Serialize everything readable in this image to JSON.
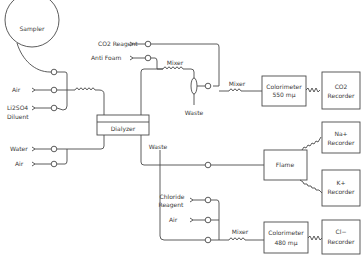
{
  "diagram": {
    "type": "flow-schematic",
    "nodes": {
      "sampler": {
        "label": "Sampler"
      },
      "air_1": {
        "label": "Air"
      },
      "diluent": {
        "label_line1": "Li2SO4",
        "label_line2": "Diluent"
      },
      "co2_reagent": {
        "label": "CO2 Reagent"
      },
      "anti_foam": {
        "label": "Anti Foam"
      },
      "mixer_top": {
        "label": "Mixer"
      },
      "waste_top": {
        "label": "Waste"
      },
      "mixer_co2": {
        "label": "Mixer"
      },
      "colorimeter_550": {
        "label_line1": "Colorimeter",
        "label_line2": "550 mμ"
      },
      "co2_recorder": {
        "label_line1": "CO2",
        "label_line2": "Recorder"
      },
      "dialyzer": {
        "label": "Dialyzer"
      },
      "water": {
        "label": "Water"
      },
      "air_2": {
        "label": "Air"
      },
      "waste_mid": {
        "label": "Waste"
      },
      "flame": {
        "label": "Flame"
      },
      "na_recorder": {
        "label_line1": "Na+",
        "label_line2": "Recorder"
      },
      "k_recorder": {
        "label_line1": "K+",
        "label_line2": "Recorder"
      },
      "chloride_reagent": {
        "label_line1": "Chloride",
        "label_line2": "Reagent"
      },
      "air_3": {
        "label": "Air"
      },
      "mixer_cl": {
        "label": "Mixer"
      },
      "colorimeter_480": {
        "label_line1": "Colorimeter",
        "label_line2": "480 mμ"
      },
      "cl_recorder": {
        "label_line1": "Cl−",
        "label_line2": "Recorder"
      }
    },
    "edges": [
      [
        "sampler",
        "dialyzer"
      ],
      [
        "air_1",
        "dialyzer"
      ],
      [
        "diluent",
        "dialyzer"
      ],
      [
        "water",
        "dialyzer"
      ],
      [
        "air_2",
        "dialyzer"
      ],
      [
        "dialyzer",
        "mixer_top"
      ],
      [
        "anti_foam",
        "mixer_top"
      ],
      [
        "mixer_top",
        "waste_top"
      ],
      [
        "co2_reagent",
        "mixer_co2"
      ],
      [
        "waste_top",
        "mixer_co2"
      ],
      [
        "mixer_co2",
        "colorimeter_550"
      ],
      [
        "colorimeter_550",
        "co2_recorder"
      ],
      [
        "dialyzer",
        "flame"
      ],
      [
        "flame",
        "na_recorder"
      ],
      [
        "flame",
        "k_recorder"
      ],
      [
        "dialyzer",
        "waste_mid"
      ],
      [
        "waste_mid",
        "mixer_cl"
      ],
      [
        "chloride_reagent",
        "mixer_cl"
      ],
      [
        "air_3",
        "mixer_cl"
      ],
      [
        "mixer_cl",
        "colorimeter_480"
      ],
      [
        "colorimeter_480",
        "cl_recorder"
      ]
    ]
  }
}
